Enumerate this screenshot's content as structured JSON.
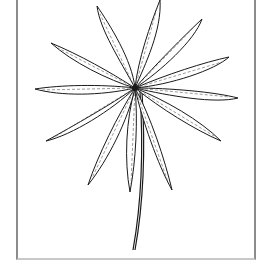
{
  "image": {
    "subject": "botanical line drawing of a whorled leaf cluster on a single stem",
    "style": "black ink on white, framed",
    "colors": {
      "ink": "#1a1a1a",
      "background": "#ffffff",
      "frame": "#8c8c8c"
    },
    "center": [
      135,
      88
    ],
    "leaves": [
      {
        "tip": [
          97,
          6
        ]
      },
      {
        "tip": [
          160,
          0
        ]
      },
      {
        "tip": [
          202,
          19
        ]
      },
      {
        "tip": [
          229,
          57
        ]
      },
      {
        "tip": [
          238,
          98
        ]
      },
      {
        "tip": [
          221,
          141
        ]
      },
      {
        "tip": [
          172,
          190
        ]
      },
      {
        "tip": [
          130,
          192
        ]
      },
      {
        "tip": [
          88,
          185
        ]
      },
      {
        "tip": [
          46,
          141
        ]
      },
      {
        "tip": [
          35,
          89
        ]
      },
      {
        "tip": [
          51,
          43
        ]
      }
    ],
    "stem": {
      "from": [
        140,
        92
      ],
      "to": [
        133,
        250
      ]
    }
  }
}
